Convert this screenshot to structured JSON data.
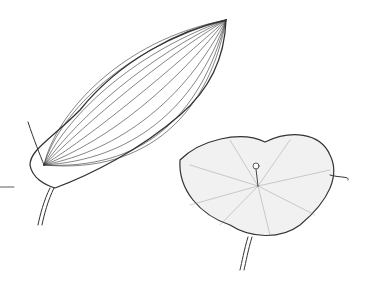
{
  "figure": {
    "background": "#ffffff",
    "ink": "#333333",
    "items": [
      {
        "name": "perfoliate-leaf",
        "description": "Elongated ovate leaf with parallel arcuate venation, clasping stem"
      },
      {
        "name": "peltate-leaf",
        "description": "Rounded peltate leaf with stippled shading and central petiole attachment"
      }
    ]
  }
}
